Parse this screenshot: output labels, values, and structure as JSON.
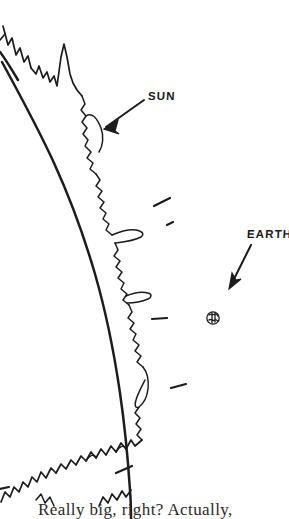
{
  "figure": {
    "background_color": "#ffffff",
    "ink_color": "#1c1c1c",
    "width": 289,
    "height": 519
  },
  "labels": {
    "sun": "SUN",
    "earth": "EARTH"
  },
  "caption": {
    "text": "Really big, right? Actually,"
  },
  "annotations": {
    "sun_arrow": "arrow pointing down-left from SUN label to the solar limb",
    "earth_arrow": "arrow pointing down-left from EARTH label to the Earth disc"
  },
  "objects": {
    "sun_limb": "smooth heavy arc of the solar disc edge",
    "corona": "jagged spiky chromosphere / prominence outline outside the limb",
    "earth_disc": "small circle with surface markings representing Earth to scale",
    "tick_marks": [
      "short diagonal dash upper area",
      "short diagonal dash mid area",
      "short horizontal dash left of Earth",
      "short diagonal dash below Earth",
      "short diagonal dash lower area",
      "short diagonal dash bottom area"
    ]
  }
}
